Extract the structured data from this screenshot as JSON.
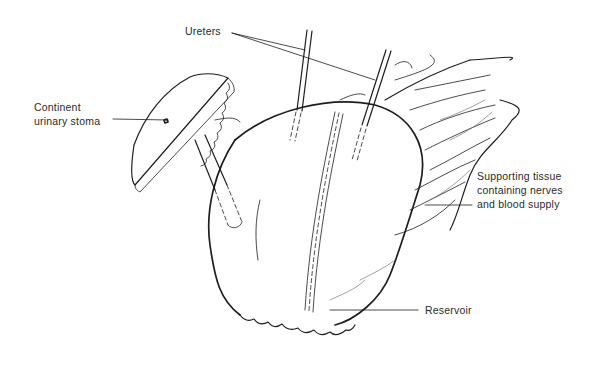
{
  "figure": {
    "colors": {
      "ink": "#1e1e1e",
      "background": "#ffffff",
      "label_text": "#2a2a2a"
    }
  },
  "labels": {
    "ureters": "Ureters",
    "stoma_line1": "Continent",
    "stoma_line2": "urinary stoma",
    "support_line1": "Supporting tissue",
    "support_line2": "containing nerves",
    "support_line3": "and blood supply",
    "reservoir": "Reservoir"
  }
}
